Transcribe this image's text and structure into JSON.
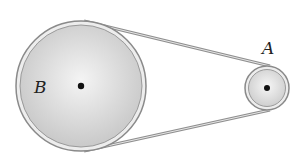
{
  "diagram": {
    "pulleys": [
      {
        "label": "B",
        "cx": 81,
        "cy": 86,
        "r": 65
      },
      {
        "label": "A",
        "cx": 267,
        "cy": 88,
        "r": 22
      }
    ],
    "colors": {
      "rim": "#8a8a8a",
      "fill": "#dcdcdc",
      "belt": "#9a9a9a",
      "hub": "#111111"
    }
  }
}
